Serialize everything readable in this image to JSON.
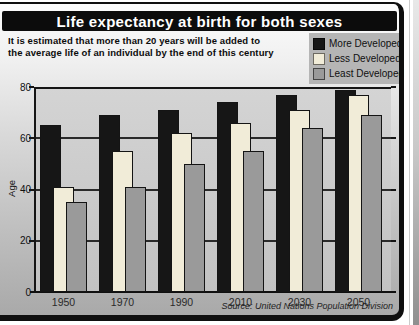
{
  "figure": {
    "title": "Life expectancy at birth for both sexes",
    "subtitle_line1": "It is estimated that more than 20 years will be added to",
    "subtitle_line2": "the average life of an individual by the end of this century",
    "source": "Source: United Nations Population Division"
  },
  "colors": {
    "frame": "#0f0f0f",
    "title_bar_bg": "#0c0c0c",
    "title_text": "#ffffff",
    "legend_bg": "#b5b5b5",
    "plot_bg": "#cccccc",
    "grid": "#2a2a2a",
    "more_developed": "#161616",
    "less_developed": "#f1ecd8",
    "least_developed": "#9a9a9a"
  },
  "chart_data": {
    "type": "bar",
    "title": "Life expectancy at birth for both sexes",
    "categories": [
      "1950",
      "1970",
      "1990",
      "2010",
      "2030",
      "2050"
    ],
    "series": [
      {
        "name": "More Developed",
        "color": "#161616",
        "values": [
          65,
          69,
          71,
          74,
          77,
          79
        ]
      },
      {
        "name": "Less Developed",
        "color": "#f1ecd8",
        "values": [
          41,
          55,
          62,
          66,
          71,
          77
        ]
      },
      {
        "name": "Least Developed",
        "color": "#9a9a9a",
        "values": [
          35,
          41,
          50,
          55,
          64,
          69
        ]
      }
    ],
    "xlabel": "",
    "ylabel": "Age",
    "ylim": [
      0,
      80
    ],
    "yticks": [
      0,
      20,
      40,
      60,
      80
    ],
    "grid": true,
    "legend_position": "top-right",
    "bar_style": "overlapping"
  }
}
